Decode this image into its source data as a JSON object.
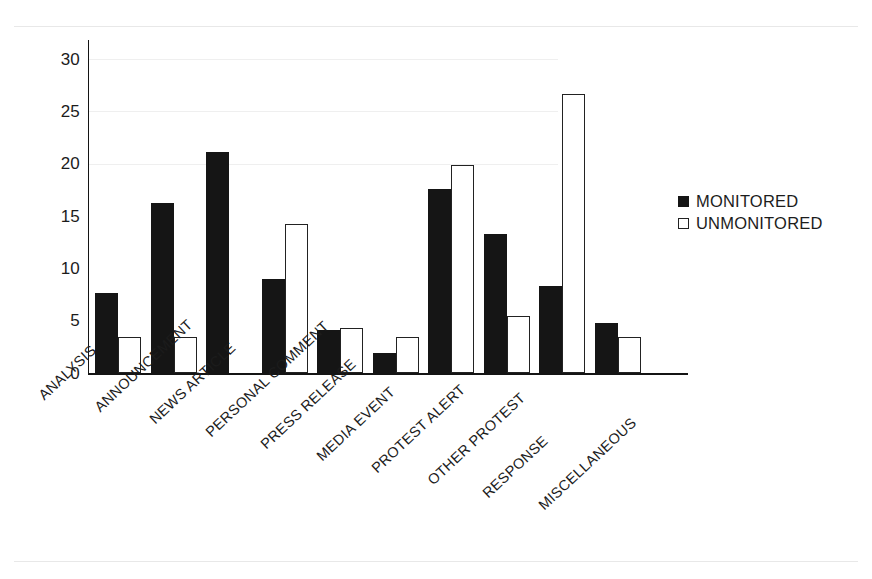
{
  "chart_data": {
    "type": "bar",
    "title": "",
    "xlabel": "",
    "ylabel": "",
    "ylim": [
      0,
      30
    ],
    "yticks": [
      0,
      5,
      10,
      15,
      20,
      25,
      30
    ],
    "grid": false,
    "legend_position": "right",
    "categories": [
      "ANALYSIS",
      "ANNOUNCEMENT",
      "NEWS ARTICLE",
      "PERSONAL COMMENT",
      "PRESS RELEASE",
      "MEDIA EVENT",
      "PROTEST ALERT",
      "OTHER PROTEST",
      "RESPONSE",
      "MISCELLANEOUS"
    ],
    "series": [
      {
        "name": "MONITORED",
        "color": "#151515",
        "style": "filled",
        "values": [
          7.6,
          16.2,
          21.1,
          9.0,
          4.1,
          1.9,
          17.6,
          13.3,
          8.3,
          4.8
        ]
      },
      {
        "name": "UNMONITORED",
        "color": "#ffffff",
        "style": "hollow",
        "values": [
          3.4,
          3.4,
          0,
          14.2,
          4.3,
          3.4,
          19.9,
          5.4,
          26.7,
          3.4
        ]
      }
    ]
  },
  "legend": {
    "items": [
      {
        "label": "MONITORED",
        "style": "filled"
      },
      {
        "label": "UNMONITORED",
        "style": "hollow"
      }
    ]
  },
  "yticks": {
    "t0": "0",
    "t1": "5",
    "t2": "10",
    "t3": "15",
    "t4": "20",
    "t5": "25",
    "t6": "30"
  }
}
